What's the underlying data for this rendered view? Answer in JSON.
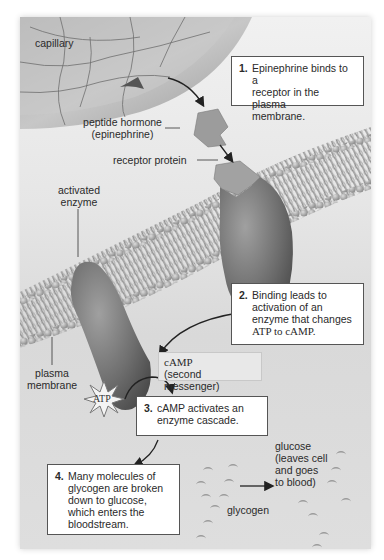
{
  "diagram": {
    "labels": {
      "capillary": "capillary",
      "peptide_hormone_1": "peptide hormone",
      "peptide_hormone_2": "(epinephrine)",
      "activated_enzyme_1": "activated",
      "activated_enzyme_2": "enzyme",
      "receptor_protein": "receptor protein",
      "plasma_membrane_1": "plasma",
      "plasma_membrane_2": "membrane",
      "atp": "ATP",
      "camp_1": "cAMP",
      "camp_2": "(second messenger)",
      "glucose_1": "glucose",
      "glucose_2": "(leaves cell",
      "glucose_3": "and goes",
      "glucose_4": "to blood)",
      "glycogen": "glycogen"
    },
    "steps": [
      {
        "num": "1.",
        "lines": [
          "Epinephrine binds to a",
          "receptor in the plasma",
          "membrane."
        ]
      },
      {
        "num": "2.",
        "lines": [
          "Binding leads to",
          "activation of an",
          "enzyme that changes",
          "ATP to cAMP."
        ]
      },
      {
        "num": "3.",
        "lines": [
          "cAMP activates an",
          "enzyme cascade."
        ]
      },
      {
        "num": "4.",
        "lines": [
          "Many molecules of",
          "glycogen are broken",
          "down to glucose,",
          "which enters the",
          "bloodstream."
        ]
      }
    ]
  }
}
